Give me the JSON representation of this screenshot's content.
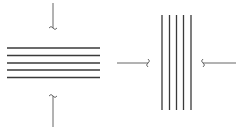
{
  "diagram": {
    "colors": {
      "layer": "#3a3a3a",
      "arrow": "#555555",
      "background": "#ffffff"
    },
    "left_stack": {
      "orientation": "horizontal",
      "layer_count": 5,
      "x_start": 7,
      "x_end": 100,
      "y_positions": [
        48,
        55.5,
        63,
        70,
        77.5
      ]
    },
    "left_stack_arrows": [
      {
        "name": "top-arrow",
        "direction": "down",
        "x": 53,
        "y_start": 3,
        "y_end": 32
      },
      {
        "name": "bottom-arrow",
        "direction": "up",
        "x": 53,
        "y_start": 127,
        "y_end": 92
      }
    ],
    "right_stack": {
      "orientation": "vertical",
      "layer_count": 5,
      "y_start": 15,
      "y_end": 110,
      "x_positions": [
        162,
        169.5,
        176.5,
        183.5,
        191
      ]
    },
    "right_stack_arrows": [
      {
        "name": "left-arrow",
        "direction": "right",
        "y": 63,
        "x_start": 117,
        "x_end": 150
      },
      {
        "name": "right-arrow",
        "direction": "left",
        "y": 63,
        "x_start": 236,
        "x_end": 201
      }
    ]
  }
}
